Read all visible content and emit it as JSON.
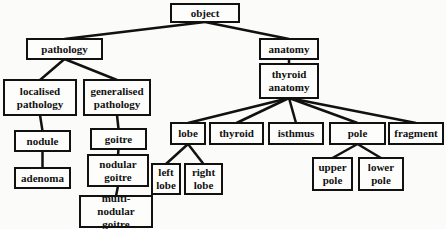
{
  "diagram": {
    "type": "tree",
    "title": "",
    "nodes": [
      {
        "id": "object",
        "label": "object",
        "x": 170,
        "y": 3,
        "w": 70,
        "h": 20
      },
      {
        "id": "pathology",
        "label": "pathology",
        "x": 26,
        "y": 38,
        "w": 77,
        "h": 22
      },
      {
        "id": "localised_pathology",
        "label": "localised pathology",
        "x": 3,
        "y": 79,
        "w": 74,
        "h": 37
      },
      {
        "id": "generalised_pathology",
        "label": "generalised pathology",
        "x": 83,
        "y": 79,
        "w": 68,
        "h": 37
      },
      {
        "id": "nodule",
        "label": "nodule",
        "x": 14,
        "y": 130,
        "w": 57,
        "h": 22
      },
      {
        "id": "adenoma",
        "label": "adenoma",
        "x": 14,
        "y": 167,
        "w": 57,
        "h": 22
      },
      {
        "id": "goitre",
        "label": "goitre",
        "x": 90,
        "y": 128,
        "w": 57,
        "h": 22
      },
      {
        "id": "nodular_goitre",
        "label": "nodular goitre",
        "x": 87,
        "y": 154,
        "w": 62,
        "h": 33
      },
      {
        "id": "multi_nodular_goitre",
        "label": "multi-nodular goitre",
        "x": 79,
        "y": 195,
        "w": 74,
        "h": 33
      },
      {
        "id": "anatomy",
        "label": "anatomy",
        "x": 259,
        "y": 38,
        "w": 60,
        "h": 22
      },
      {
        "id": "thyroid_anatomy",
        "label": "thyroid anatomy",
        "x": 259,
        "y": 63,
        "w": 60,
        "h": 36
      },
      {
        "id": "lobe",
        "label": "lobe",
        "x": 170,
        "y": 122,
        "w": 36,
        "h": 23
      },
      {
        "id": "thyroid",
        "label": "thyroid",
        "x": 209,
        "y": 122,
        "w": 55,
        "h": 23
      },
      {
        "id": "isthmus",
        "label": "isthmus",
        "x": 268,
        "y": 122,
        "w": 56,
        "h": 23
      },
      {
        "id": "pole",
        "label": "pole",
        "x": 329,
        "y": 122,
        "w": 57,
        "h": 23
      },
      {
        "id": "fragment",
        "label": "fragment",
        "x": 388,
        "y": 122,
        "w": 56,
        "h": 23
      },
      {
        "id": "left_lobe",
        "label": "left lobe",
        "x": 151,
        "y": 163,
        "w": 30,
        "h": 32
      },
      {
        "id": "right_lobe",
        "label": "right lobe",
        "x": 184,
        "y": 163,
        "w": 39,
        "h": 32
      },
      {
        "id": "upper_pole",
        "label": "upper pole",
        "x": 312,
        "y": 157,
        "w": 41,
        "h": 34
      },
      {
        "id": "lower_pole",
        "label": "lower pole",
        "x": 358,
        "y": 157,
        "w": 46,
        "h": 34
      }
    ],
    "edges": [
      [
        "object",
        "pathology"
      ],
      [
        "object",
        "anatomy"
      ],
      [
        "pathology",
        "localised_pathology"
      ],
      [
        "pathology",
        "generalised_pathology"
      ],
      [
        "localised_pathology",
        "nodule"
      ],
      [
        "nodule",
        "adenoma"
      ],
      [
        "generalised_pathology",
        "goitre"
      ],
      [
        "goitre",
        "nodular_goitre"
      ],
      [
        "nodular_goitre",
        "multi_nodular_goitre"
      ],
      [
        "anatomy",
        "thyroid_anatomy"
      ],
      [
        "thyroid_anatomy",
        "lobe"
      ],
      [
        "thyroid_anatomy",
        "thyroid"
      ],
      [
        "thyroid_anatomy",
        "isthmus"
      ],
      [
        "thyroid_anatomy",
        "pole"
      ],
      [
        "thyroid_anatomy",
        "fragment"
      ],
      [
        "lobe",
        "left_lobe"
      ],
      [
        "lobe",
        "right_lobe"
      ],
      [
        "pole",
        "upper_pole"
      ],
      [
        "pole",
        "lower_pole"
      ]
    ],
    "colors": {
      "line": "#111111",
      "box_border": "#111111",
      "background": "#fbfbfa"
    }
  }
}
